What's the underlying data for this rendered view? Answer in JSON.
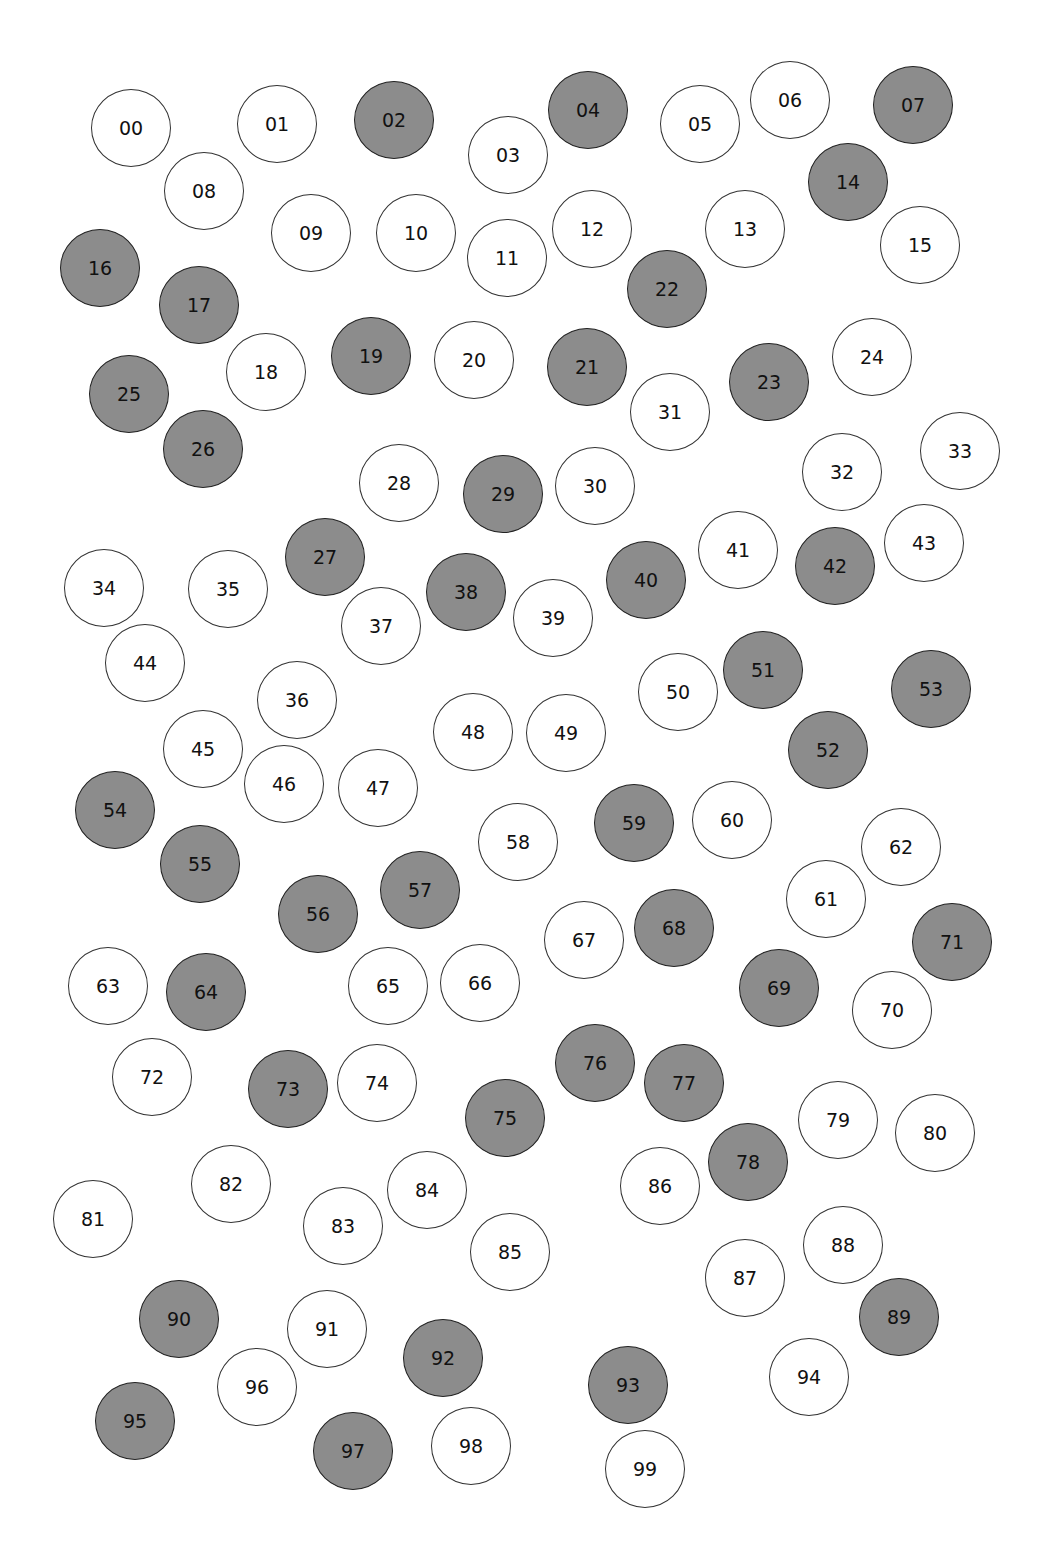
{
  "colors": {
    "shaded": "#8c8c8c",
    "plain": "#ffffff",
    "stroke": "#333333"
  },
  "circles": [
    {
      "label": "00",
      "x": 131,
      "y": 128,
      "shaded": false
    },
    {
      "label": "01",
      "x": 277,
      "y": 124,
      "shaded": false
    },
    {
      "label": "02",
      "x": 394,
      "y": 120,
      "shaded": true
    },
    {
      "label": "03",
      "x": 508,
      "y": 155,
      "shaded": false
    },
    {
      "label": "04",
      "x": 588,
      "y": 110,
      "shaded": true
    },
    {
      "label": "05",
      "x": 700,
      "y": 124,
      "shaded": false
    },
    {
      "label": "06",
      "x": 790,
      "y": 100,
      "shaded": false
    },
    {
      "label": "07",
      "x": 913,
      "y": 105,
      "shaded": true
    },
    {
      "label": "08",
      "x": 204,
      "y": 191,
      "shaded": false
    },
    {
      "label": "09",
      "x": 311,
      "y": 233,
      "shaded": false
    },
    {
      "label": "10",
      "x": 416,
      "y": 233,
      "shaded": false
    },
    {
      "label": "11",
      "x": 507,
      "y": 258,
      "shaded": false
    },
    {
      "label": "12",
      "x": 592,
      "y": 229,
      "shaded": false
    },
    {
      "label": "13",
      "x": 745,
      "y": 229,
      "shaded": false
    },
    {
      "label": "14",
      "x": 848,
      "y": 182,
      "shaded": true
    },
    {
      "label": "15",
      "x": 920,
      "y": 245,
      "shaded": false
    },
    {
      "label": "16",
      "x": 100,
      "y": 268,
      "shaded": true
    },
    {
      "label": "17",
      "x": 199,
      "y": 305,
      "shaded": true
    },
    {
      "label": "18",
      "x": 266,
      "y": 372,
      "shaded": false
    },
    {
      "label": "19",
      "x": 371,
      "y": 356,
      "shaded": true
    },
    {
      "label": "20",
      "x": 474,
      "y": 360,
      "shaded": false
    },
    {
      "label": "21",
      "x": 587,
      "y": 367,
      "shaded": true
    },
    {
      "label": "22",
      "x": 667,
      "y": 289,
      "shaded": true
    },
    {
      "label": "23",
      "x": 769,
      "y": 382,
      "shaded": true
    },
    {
      "label": "24",
      "x": 872,
      "y": 357,
      "shaded": false
    },
    {
      "label": "25",
      "x": 129,
      "y": 394,
      "shaded": true
    },
    {
      "label": "26",
      "x": 203,
      "y": 449,
      "shaded": true
    },
    {
      "label": "27",
      "x": 325,
      "y": 557,
      "shaded": true
    },
    {
      "label": "28",
      "x": 399,
      "y": 483,
      "shaded": false
    },
    {
      "label": "29",
      "x": 503,
      "y": 494,
      "shaded": true
    },
    {
      "label": "30",
      "x": 595,
      "y": 486,
      "shaded": false
    },
    {
      "label": "31",
      "x": 670,
      "y": 412,
      "shaded": false
    },
    {
      "label": "32",
      "x": 842,
      "y": 472,
      "shaded": false
    },
    {
      "label": "33",
      "x": 960,
      "y": 451,
      "shaded": false
    },
    {
      "label": "34",
      "x": 104,
      "y": 588,
      "shaded": false
    },
    {
      "label": "35",
      "x": 228,
      "y": 589,
      "shaded": false
    },
    {
      "label": "36",
      "x": 297,
      "y": 700,
      "shaded": false
    },
    {
      "label": "37",
      "x": 381,
      "y": 626,
      "shaded": false
    },
    {
      "label": "38",
      "x": 466,
      "y": 592,
      "shaded": true
    },
    {
      "label": "39",
      "x": 553,
      "y": 618,
      "shaded": false
    },
    {
      "label": "40",
      "x": 646,
      "y": 580,
      "shaded": true
    },
    {
      "label": "41",
      "x": 738,
      "y": 550,
      "shaded": false
    },
    {
      "label": "42",
      "x": 835,
      "y": 566,
      "shaded": true
    },
    {
      "label": "43",
      "x": 924,
      "y": 543,
      "shaded": false
    },
    {
      "label": "44",
      "x": 145,
      "y": 663,
      "shaded": false
    },
    {
      "label": "45",
      "x": 203,
      "y": 749,
      "shaded": false
    },
    {
      "label": "46",
      "x": 284,
      "y": 784,
      "shaded": false
    },
    {
      "label": "47",
      "x": 378,
      "y": 788,
      "shaded": false
    },
    {
      "label": "48",
      "x": 473,
      "y": 732,
      "shaded": false
    },
    {
      "label": "49",
      "x": 566,
      "y": 733,
      "shaded": false
    },
    {
      "label": "50",
      "x": 678,
      "y": 692,
      "shaded": false
    },
    {
      "label": "51",
      "x": 763,
      "y": 670,
      "shaded": true
    },
    {
      "label": "52",
      "x": 828,
      "y": 750,
      "shaded": true
    },
    {
      "label": "53",
      "x": 931,
      "y": 689,
      "shaded": true
    },
    {
      "label": "54",
      "x": 115,
      "y": 810,
      "shaded": true
    },
    {
      "label": "55",
      "x": 200,
      "y": 864,
      "shaded": true
    },
    {
      "label": "56",
      "x": 318,
      "y": 914,
      "shaded": true
    },
    {
      "label": "57",
      "x": 420,
      "y": 890,
      "shaded": true
    },
    {
      "label": "58",
      "x": 518,
      "y": 842,
      "shaded": false
    },
    {
      "label": "59",
      "x": 634,
      "y": 823,
      "shaded": true
    },
    {
      "label": "60",
      "x": 732,
      "y": 820,
      "shaded": false
    },
    {
      "label": "61",
      "x": 826,
      "y": 899,
      "shaded": false
    },
    {
      "label": "62",
      "x": 901,
      "y": 847,
      "shaded": false
    },
    {
      "label": "63",
      "x": 108,
      "y": 986,
      "shaded": false
    },
    {
      "label": "64",
      "x": 206,
      "y": 992,
      "shaded": true
    },
    {
      "label": "65",
      "x": 388,
      "y": 986,
      "shaded": false
    },
    {
      "label": "66",
      "x": 480,
      "y": 983,
      "shaded": false
    },
    {
      "label": "67",
      "x": 584,
      "y": 940,
      "shaded": false
    },
    {
      "label": "68",
      "x": 674,
      "y": 928,
      "shaded": true
    },
    {
      "label": "69",
      "x": 779,
      "y": 988,
      "shaded": true
    },
    {
      "label": "70",
      "x": 892,
      "y": 1010,
      "shaded": false
    },
    {
      "label": "71",
      "x": 952,
      "y": 942,
      "shaded": true
    },
    {
      "label": "72",
      "x": 152,
      "y": 1077,
      "shaded": false
    },
    {
      "label": "73",
      "x": 288,
      "y": 1089,
      "shaded": true
    },
    {
      "label": "74",
      "x": 377,
      "y": 1083,
      "shaded": false
    },
    {
      "label": "75",
      "x": 505,
      "y": 1118,
      "shaded": true
    },
    {
      "label": "76",
      "x": 595,
      "y": 1063,
      "shaded": true
    },
    {
      "label": "77",
      "x": 684,
      "y": 1083,
      "shaded": true
    },
    {
      "label": "78",
      "x": 748,
      "y": 1162,
      "shaded": true
    },
    {
      "label": "79",
      "x": 838,
      "y": 1120,
      "shaded": false
    },
    {
      "label": "80",
      "x": 935,
      "y": 1133,
      "shaded": false
    },
    {
      "label": "81",
      "x": 93,
      "y": 1219,
      "shaded": false
    },
    {
      "label": "82",
      "x": 231,
      "y": 1184,
      "shaded": false
    },
    {
      "label": "83",
      "x": 343,
      "y": 1226,
      "shaded": false
    },
    {
      "label": "84",
      "x": 427,
      "y": 1190,
      "shaded": false
    },
    {
      "label": "85",
      "x": 510,
      "y": 1252,
      "shaded": false
    },
    {
      "label": "86",
      "x": 660,
      "y": 1186,
      "shaded": false
    },
    {
      "label": "87",
      "x": 745,
      "y": 1278,
      "shaded": false
    },
    {
      "label": "88",
      "x": 843,
      "y": 1245,
      "shaded": false
    },
    {
      "label": "89",
      "x": 899,
      "y": 1317,
      "shaded": true
    },
    {
      "label": "90",
      "x": 179,
      "y": 1319,
      "shaded": true
    },
    {
      "label": "91",
      "x": 327,
      "y": 1329,
      "shaded": false
    },
    {
      "label": "92",
      "x": 443,
      "y": 1358,
      "shaded": true
    },
    {
      "label": "93",
      "x": 628,
      "y": 1385,
      "shaded": true
    },
    {
      "label": "94",
      "x": 809,
      "y": 1377,
      "shaded": false
    },
    {
      "label": "95",
      "x": 135,
      "y": 1421,
      "shaded": true
    },
    {
      "label": "96",
      "x": 257,
      "y": 1387,
      "shaded": false
    },
    {
      "label": "97",
      "x": 353,
      "y": 1451,
      "shaded": true
    },
    {
      "label": "98",
      "x": 471,
      "y": 1446,
      "shaded": false
    },
    {
      "label": "99",
      "x": 645,
      "y": 1469,
      "shaded": false
    }
  ]
}
